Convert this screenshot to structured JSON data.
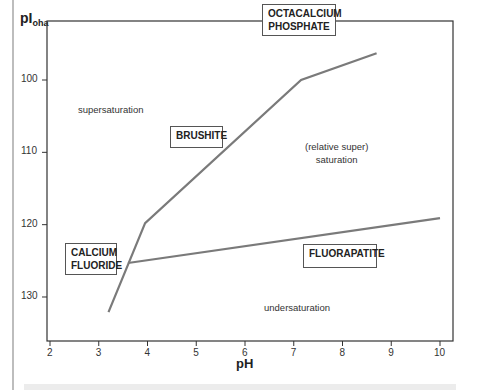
{
  "chart_data": {
    "type": "line",
    "title": "",
    "xlabel": "pH",
    "ylabel": "pI_oha",
    "ylabel_main": "pI",
    "ylabel_sub": "oha",
    "xlim": [
      2,
      10.3
    ],
    "ylim": [
      137,
      95
    ],
    "y_inverted": true,
    "grid": false,
    "x_ticks": [
      "2",
      "3",
      "4",
      "5",
      "6",
      "7",
      "8",
      "9",
      "10"
    ],
    "y_ticks": [
      "100",
      "110",
      "120",
      "130"
    ],
    "series": [
      {
        "name": "solubility boundary (calcium fluoride / brushite / octacalcium phosphate)",
        "x": [
          3.2,
          3.95,
          7.15,
          8.7
        ],
        "y": [
          132.1,
          119.8,
          100.0,
          96.3
        ]
      },
      {
        "name": "fluorapatite boundary",
        "x": [
          3.6,
          10.0
        ],
        "y": [
          125.3,
          119.1
        ]
      }
    ],
    "annotations": [
      {
        "text": "OCTACALCIUM PHOSPHATE",
        "boxed": true,
        "x": 7.4,
        "y": 98.0
      },
      {
        "text": "BRUSHITE",
        "boxed": true,
        "x": 5.0,
        "y": 108.5
      },
      {
        "text": "CALCIUM FLUORIDE",
        "boxed": true,
        "x": 2.9,
        "y": 125.0
      },
      {
        "text": "FLUORAPATITE",
        "boxed": true,
        "x": 8.1,
        "y": 125.0
      },
      {
        "text": "supersaturation",
        "boxed": false,
        "x": 3.9,
        "y": 107.0
      },
      {
        "text": "(relative super) saturation",
        "boxed": false,
        "x": 7.6,
        "y": 110.0
      },
      {
        "text": "undersaturation",
        "boxed": false,
        "x": 6.8,
        "y": 131.0
      }
    ]
  },
  "labels": {
    "ylabel_main": "pI",
    "ylabel_sub": "oha",
    "xlabel": "pH",
    "octacalcium_line1": "OCTACALCIUM",
    "octacalcium_line2": "PHOSPHATE",
    "brushite": "BRUSHITE",
    "calcium_line1": "CALCIUM",
    "calcium_line2": "FLUORIDE",
    "fluorapatite": "FLUORAPATITE",
    "supersaturation": "supersaturation",
    "relative_line1": "(relative super)",
    "relative_line2": "saturation",
    "undersaturation": "undersaturation"
  },
  "colors": {
    "curve": "#7a7a7a",
    "axis": "#333333",
    "box_border": "#555555"
  }
}
